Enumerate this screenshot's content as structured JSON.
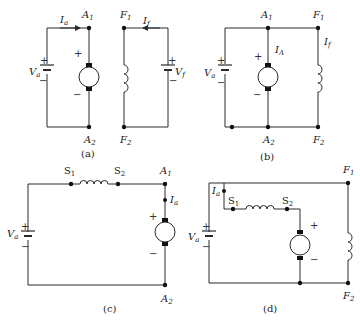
{
  "figure": {
    "panels": [
      {
        "id": "a",
        "caption": "(a)",
        "description": "Separately excited DC machine",
        "labels": {
          "armature_current": "I",
          "armature_current_sub": "a",
          "a1": "A",
          "a1_sub": "1",
          "a2": "A",
          "a2_sub": "2",
          "f1": "F",
          "f1_sub": "1",
          "f2": "F",
          "f2_sub": "2",
          "field_current": "I",
          "field_current_sub": "f",
          "va": "V",
          "va_sub": "a",
          "vf": "V",
          "vf_sub": "f",
          "plus": "+",
          "minus": "−"
        }
      },
      {
        "id": "b",
        "caption": "(b)",
        "description": "Shunt DC machine",
        "labels": {
          "a1": "A",
          "a1_sub": "1",
          "a2": "A",
          "a2_sub": "2",
          "f1": "F",
          "f1_sub": "1",
          "f2": "F",
          "f2_sub": "2",
          "armature_current": "I",
          "armature_current_sub": "A",
          "field_current": "I",
          "field_current_sub": "f",
          "va": "V",
          "va_sub": "a",
          "plus": "+",
          "minus": "−"
        }
      },
      {
        "id": "c",
        "caption": "(c)",
        "description": "Series DC machine",
        "labels": {
          "s1": "S",
          "s1_sub": "1",
          "s2": "S",
          "s2_sub": "2",
          "a1": "A",
          "a1_sub": "1",
          "a2": "A",
          "a2_sub": "2",
          "armature_current": "I",
          "armature_current_sub": "a",
          "va": "V",
          "va_sub": "a",
          "plus": "+",
          "minus": "−"
        }
      },
      {
        "id": "d",
        "caption": "(d)",
        "description": "Compound DC machine",
        "labels": {
          "f1": "F",
          "f1_sub": "1",
          "f2": "F",
          "f2_sub": "2",
          "s1": "S",
          "s1_sub": "1",
          "s2": "S",
          "s2_sub": "2",
          "armature_current": "I",
          "armature_current_sub": "a",
          "va": "V",
          "va_sub": "a",
          "plus": "+",
          "minus": "−"
        }
      }
    ],
    "colors": {
      "line": "#2a2a2a",
      "text": "#222222",
      "background": "#ffffff"
    }
  }
}
